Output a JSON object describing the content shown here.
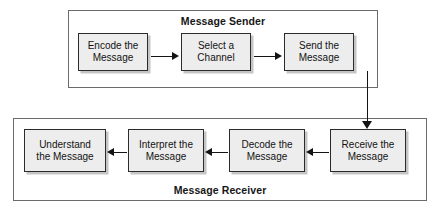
{
  "diagram": {
    "type": "flowchart",
    "groups": [
      {
        "id": "sender",
        "label": "Message Sender",
        "label_position": "top",
        "nodes": [
          {
            "id": "encode",
            "label": "Encode the\nMessage"
          },
          {
            "id": "select",
            "label": "Select a\nChannel"
          },
          {
            "id": "send",
            "label": "Send the\nMessage"
          }
        ]
      },
      {
        "id": "receiver",
        "label": "Message Receiver",
        "label_position": "bottom",
        "nodes": [
          {
            "id": "understand",
            "label": "Understand\nthe Message"
          },
          {
            "id": "interpret",
            "label": "Interpret the\nMessage"
          },
          {
            "id": "decode",
            "label": "Decode the\nMessage"
          },
          {
            "id": "receive",
            "label": "Receive the\nMessage"
          }
        ]
      }
    ],
    "connectors": [
      {
        "id": "c1",
        "from": "encode",
        "to": "select",
        "direction": "right"
      },
      {
        "id": "c2",
        "from": "select",
        "to": "send",
        "direction": "right"
      },
      {
        "id": "c3",
        "from": "send",
        "to": "receive",
        "direction": "down"
      },
      {
        "id": "c4",
        "from": "receive",
        "to": "decode",
        "direction": "left"
      },
      {
        "id": "c5",
        "from": "decode",
        "to": "interpret",
        "direction": "left"
      },
      {
        "id": "c6",
        "from": "interpret",
        "to": "understand",
        "direction": "left"
      }
    ],
    "colors": {
      "node_fill": "#ededed",
      "node_border": "#2b2b2b",
      "group_border": "#6b6b6b",
      "connector": "#141414",
      "text": "#131313",
      "background": "#ffffff"
    }
  }
}
